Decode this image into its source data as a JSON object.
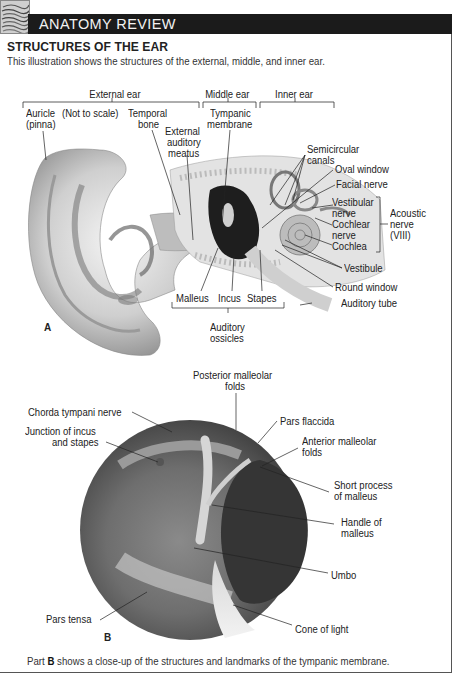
{
  "header": {
    "logo_icon": "anatomy-sketch-logo",
    "title": "ANATOMY REVIEW"
  },
  "section": {
    "title": "STRUCTURES OF THE EAR",
    "intro": "This illustration shows the structures of the external, middle, and inner ear."
  },
  "figure_a": {
    "letter": "A",
    "groups": {
      "external_ear": "External ear",
      "middle_ear": "Middle ear",
      "inner_ear": "Inner ear",
      "auditory_ossicles_line1": "Auditory",
      "auditory_ossicles_line2": "ossicles",
      "acoustic_nerve_line1": "Acoustic",
      "acoustic_nerve_line2": "nerve",
      "acoustic_nerve_line3": "(VIII)"
    },
    "labels": {
      "auricle_line1": "Auricle",
      "auricle_line2": "(pinna)",
      "not_to_scale": "(Not to scale)",
      "temporal_bone_line1": "Temporal",
      "temporal_bone_line2": "bone",
      "external_meatus_line1": "External",
      "external_meatus_line2": "auditory",
      "external_meatus_line3": "meatus",
      "tympanic_membrane_line1": "Tympanic",
      "tympanic_membrane_line2": "membrane",
      "semicircular_canals_line1": "Semicircular",
      "semicircular_canals_line2": "canals",
      "oval_window": "Oval window",
      "facial_nerve": "Facial nerve",
      "vestibular_nerve_line1": "Vestibular",
      "vestibular_nerve_line2": "nerve",
      "cochlear_nerve_line1": "Cochlear",
      "cochlear_nerve_line2": "nerve",
      "cochlea": "Cochlea",
      "vestibule": "Vestibule",
      "round_window": "Round window",
      "auditory_tube": "Auditory tube",
      "malleus": "Malleus",
      "incus": "Incus",
      "stapes": "Stapes"
    }
  },
  "figure_b": {
    "letter": "B",
    "labels": {
      "posterior_malleolar_line1": "Posterior malleolar",
      "posterior_malleolar_line2": "folds",
      "chorda_tympani": "Chorda tympani nerve",
      "junction_line1": "Junction of incus",
      "junction_line2": "and stapes",
      "pars_flaccida": "Pars flaccida",
      "anterior_malleolar_line1": "Anterior malleolar",
      "anterior_malleolar_line2": "folds",
      "short_process_line1": "Short process",
      "short_process_line2": "of malleus",
      "handle_line1": "Handle of",
      "handle_line2": "malleus",
      "umbo": "Umbo",
      "pars_tensa": "Pars tensa",
      "cone_of_light": "Cone of light"
    }
  },
  "caption": {
    "prefix": "Part ",
    "bold": "B",
    "suffix": " shows a close-up of the structures and landmarks of the tympanic membrane."
  },
  "colors": {
    "header_bg": "#1b1b1b",
    "header_text": "#f2f2f2",
    "border": "#555555",
    "text": "#222222"
  }
}
